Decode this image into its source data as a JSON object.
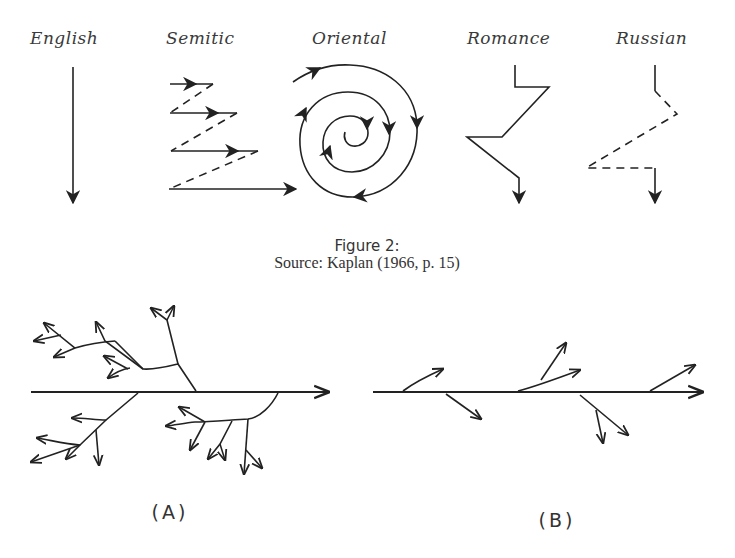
{
  "figure": {
    "styles": [
      {
        "label": "English",
        "pattern": "straight-down-arrow"
      },
      {
        "label": "Semitic",
        "pattern": "parallel-zigzag-lines"
      },
      {
        "label": "Oriental",
        "pattern": "inward-spiral"
      },
      {
        "label": "Romance",
        "pattern": "digressive-zigzag"
      },
      {
        "label": "Russian",
        "pattern": "dashed-digressive-zigzag"
      }
    ],
    "caption_title": "Figure 2:",
    "caption_source": "Source: Kaplan (1966, p. 15)"
  },
  "tree_diagrams": [
    {
      "label": "(A)",
      "pattern": "branching-tree-many-digressions"
    },
    {
      "label": "(B)",
      "pattern": "linear-with-few-branches"
    }
  ],
  "colors": {
    "ink": "#222222",
    "background": "#ffffff"
  }
}
